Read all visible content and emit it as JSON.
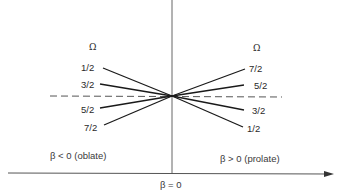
{
  "diagram": {
    "type": "Nilsson-style level splitting schematic",
    "horizontal_axis": {
      "label": "β = 0",
      "has_arrow": true
    },
    "vertical_axis": {
      "label": ""
    },
    "center_reference": "dashed horizontal line (unperturbed level)",
    "left_region": {
      "header": "Ω",
      "label": "β < 0 (oblate)",
      "levels_top_to_bottom": [
        "1/2",
        "3/2",
        "5/2",
        "7/2"
      ]
    },
    "right_region": {
      "header": "Ω",
      "label": "β > 0 (prolate)",
      "levels_top_to_bottom": [
        "7/2",
        "5/2",
        "3/2",
        "1/2"
      ]
    },
    "colors": {
      "line": "#1a1a1a",
      "axis": "#555555",
      "dashed": "#555555",
      "text": "#2a2a2a"
    }
  }
}
